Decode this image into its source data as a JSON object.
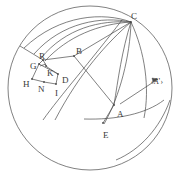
{
  "figure": {
    "stroke_color": "#4a4a4a",
    "label_color": "#3a3a3a",
    "background_color": "#ffffff",
    "canvas": {
      "width": 180,
      "height": 182
    }
  },
  "outer_circle": {
    "name": "bounding-great-circle",
    "cx": 90,
    "cy": 88,
    "r": 82
  },
  "labels": [
    {
      "id": "C",
      "text": "C",
      "x": 131,
      "y": 12,
      "size": "normal"
    },
    {
      "id": "B",
      "text": "B",
      "x": 76,
      "y": 47,
      "size": "normal"
    },
    {
      "id": "R",
      "text": "R",
      "x": 39,
      "y": 52,
      "size": "normal"
    },
    {
      "id": "G",
      "text": "G",
      "x": 30,
      "y": 62,
      "size": "normal"
    },
    {
      "id": "K",
      "text": "K",
      "x": 47,
      "y": 69,
      "size": "normal"
    },
    {
      "id": "H",
      "text": "H",
      "x": 23,
      "y": 80,
      "size": "normal"
    },
    {
      "id": "N",
      "text": "N",
      "x": 38,
      "y": 85,
      "size": "normal"
    },
    {
      "id": "I",
      "text": "I",
      "x": 55,
      "y": 89,
      "size": "normal"
    },
    {
      "id": "D",
      "text": "D",
      "x": 62,
      "y": 76,
      "size": "normal"
    },
    {
      "id": "A",
      "text": "A",
      "x": 117,
      "y": 110,
      "size": "normal"
    },
    {
      "id": "E",
      "text": "E",
      "x": 103,
      "y": 131,
      "size": "normal"
    },
    {
      "id": "Aprime",
      "text": "‹A’›",
      "x": 151,
      "y": 78,
      "size": "small"
    }
  ],
  "points": [
    {
      "id": "C",
      "x": 131,
      "y": 22
    },
    {
      "id": "B",
      "x": 74,
      "y": 56
    },
    {
      "id": "R",
      "x": 43,
      "y": 60
    },
    {
      "id": "G",
      "x": 39,
      "y": 64
    },
    {
      "id": "K",
      "x": 46,
      "y": 66
    },
    {
      "id": "H",
      "x": 32,
      "y": 79
    },
    {
      "id": "N",
      "x": 44,
      "y": 82
    },
    {
      "id": "I",
      "x": 56,
      "y": 84
    },
    {
      "id": "D",
      "x": 58,
      "y": 74
    },
    {
      "id": "A",
      "x": 114,
      "y": 105
    },
    {
      "id": "E",
      "x": 103,
      "y": 123
    }
  ],
  "arcs_to_C": [
    {
      "name": "arc-C-to-left-upper-1",
      "d": "M 131 22 C 104 12, 60 14, 24 48"
    },
    {
      "name": "arc-C-to-left-upper-2",
      "d": "M 131 22 C 102 16, 62 22, 34 54"
    },
    {
      "name": "arc-C-to-left-upper-3",
      "d": "M 131 22 C 100 20, 66 28, 41 58"
    },
    {
      "name": "arc-C-to-R",
      "d": "M 131 22 C 99 24, 68 36, 45 61"
    },
    {
      "name": "arc-C-to-A-inner",
      "d": "M 131 22 C 122 50, 118 80, 114 105"
    },
    {
      "name": "arc-C-to-E-outer",
      "d": "M 131 22 C 130 56, 120 96, 104 124"
    },
    {
      "name": "arc-C-through-B-to-lower-left",
      "d": "M 131 22 C 108 42, 80 72, 55 120"
    },
    {
      "name": "arc-C-long-right",
      "d": "M 131 22 C 145 52, 150 88, 144 118"
    }
  ],
  "straight_segments": [
    {
      "name": "segment-C-to-B",
      "x1": 131,
      "y1": 22,
      "x2": 74,
      "y2": 56
    },
    {
      "name": "segment-B-to-R",
      "x1": 74,
      "y1": 56,
      "x2": 43,
      "y2": 60
    },
    {
      "name": "segment-B-to-A",
      "x1": 74,
      "y1": 56,
      "x2": 114,
      "y2": 105
    },
    {
      "name": "segment-R-ray-upper-left",
      "x1": 43,
      "y1": 60,
      "x2": 20,
      "y2": 46
    },
    {
      "name": "segment-R-to-K",
      "x1": 43,
      "y1": 60,
      "x2": 47,
      "y2": 67
    },
    {
      "name": "segment-K-to-D",
      "x1": 47,
      "y1": 67,
      "x2": 58,
      "y2": 74
    },
    {
      "name": "segment-G-to-H",
      "x1": 39,
      "y1": 64,
      "x2": 32,
      "y2": 79
    },
    {
      "name": "segment-H-to-N",
      "x1": 32,
      "y1": 79,
      "x2": 44,
      "y2": 82
    },
    {
      "name": "segment-N-to-I",
      "x1": 44,
      "y1": 82,
      "x2": 56,
      "y2": 84
    },
    {
      "name": "segment-I-to-D",
      "x1": 56,
      "y1": 84,
      "x2": 58,
      "y2": 74
    },
    {
      "name": "segment-G-to-R",
      "x1": 39,
      "y1": 64,
      "x2": 43,
      "y2": 60
    },
    {
      "name": "segment-G-to-D",
      "x1": 39,
      "y1": 64,
      "x2": 58,
      "y2": 74
    },
    {
      "name": "segment-K-short-tick",
      "x1": 46,
      "y1": 64,
      "x2": 40,
      "y2": 66
    },
    {
      "name": "segment-A-to-Aprime",
      "x1": 120,
      "y1": 104,
      "x2": 158,
      "y2": 79
    },
    {
      "name": "segment-A-to-E",
      "x1": 114,
      "y1": 105,
      "x2": 103,
      "y2": 123
    }
  ],
  "free_arcs": [
    {
      "name": "arc-lower-left-diagonal",
      "d": "M 43 120 C 60 96, 90 62, 122 20"
    },
    {
      "name": "arc-through-E-right",
      "d": "M 84 119 C 116 120, 146 114, 164 100"
    },
    {
      "name": "arc-outer-lower-right",
      "d": "M 116 160 C 140 150, 160 128, 170 100"
    }
  ]
}
